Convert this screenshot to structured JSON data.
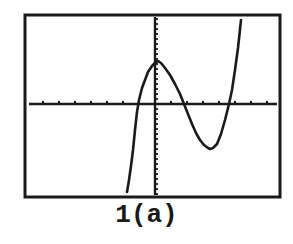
{
  "chart_data": {
    "type": "line",
    "title": "",
    "caption": "1(a)",
    "xlabel": "",
    "ylabel": "",
    "grid": false,
    "legend": null,
    "x_tick_marks": true,
    "y_tick_marks": true,
    "series": [
      {
        "name": "f(x)",
        "points_px": [
          [
            127,
            192
          ],
          [
            129,
            180
          ],
          [
            131,
            166
          ],
          [
            133,
            150
          ],
          [
            135,
            130
          ],
          [
            137,
            112
          ],
          [
            139,
            100
          ],
          [
            142,
            88
          ],
          [
            145,
            80
          ],
          [
            148,
            72
          ],
          [
            152,
            66
          ],
          [
            156,
            62
          ],
          [
            158,
            61
          ],
          [
            161,
            63
          ],
          [
            165,
            68
          ],
          [
            170,
            75
          ],
          [
            175,
            84
          ],
          [
            180,
            94
          ],
          [
            184,
            104
          ],
          [
            188,
            114
          ],
          [
            192,
            124
          ],
          [
            196,
            133
          ],
          [
            200,
            140
          ],
          [
            204,
            145
          ],
          [
            208,
            148
          ],
          [
            210,
            149
          ],
          [
            213,
            148
          ],
          [
            217,
            144
          ],
          [
            221,
            134
          ],
          [
            225,
            120
          ],
          [
            229,
            104
          ],
          [
            232,
            90
          ],
          [
            235,
            70
          ],
          [
            238,
            48
          ],
          [
            241,
            20
          ]
        ]
      }
    ],
    "x_intercepts_px": [
      137,
      184,
      229
    ],
    "local_max_px": [
      158,
      61
    ],
    "local_min_px": [
      210,
      149
    ]
  },
  "plot": {
    "frame": {
      "x": 25,
      "y": 15,
      "w": 255,
      "h": 182
    },
    "x_axis_y": 104,
    "y_axis_x": 155,
    "x_tick_spacing": 16,
    "y_tick_spacing": 5,
    "colors": {
      "ink": "#1a1a1a",
      "background": "#ffffff"
    }
  }
}
